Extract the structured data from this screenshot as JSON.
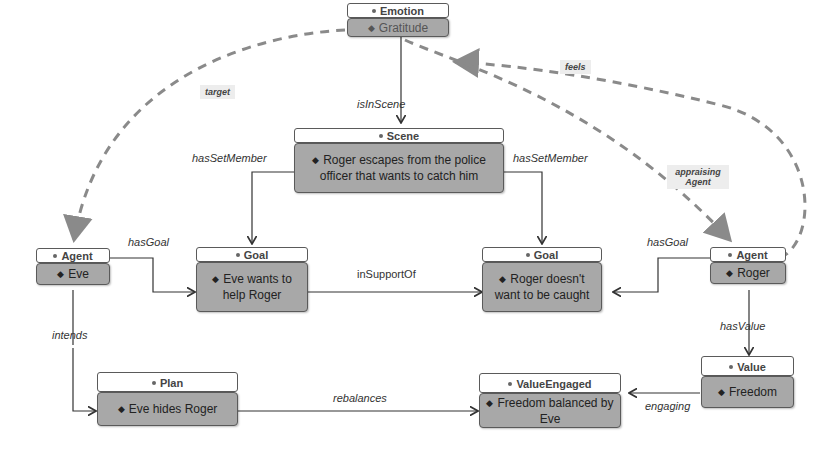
{
  "nodes": {
    "emotion": {
      "type": "Emotion",
      "value": "Gratitude"
    },
    "scene": {
      "type": "Scene",
      "value": "Roger escapes from the police officer that wants to catch him"
    },
    "agent_eve": {
      "type": "Agent",
      "value": "Eve"
    },
    "goal_eve": {
      "type": "Goal",
      "value": "Eve wants to help Roger"
    },
    "goal_roger": {
      "type": "Goal",
      "value": "Roger doesn't want to be caught"
    },
    "agent_roger": {
      "type": "Agent",
      "value": "Roger"
    },
    "plan": {
      "type": "Plan",
      "value": "Eve hides Roger"
    },
    "value_engaged": {
      "type": "ValueEngaged",
      "value": "Freedom balanced by Eve"
    },
    "value": {
      "type": "Value",
      "value": "Freedom"
    }
  },
  "edges": {
    "target": "target",
    "feels": "feels",
    "appraising_agent": "appraising Agent",
    "is_in_scene": "isInScene",
    "has_set_member_left": "hasSetMember",
    "has_set_member_right": "hasSetMember",
    "has_goal_eve": "hasGoal",
    "has_goal_roger": "hasGoal",
    "in_support_of": "inSupportOf",
    "intends": "intends",
    "has_value": "hasValue",
    "rebalances": "rebalances",
    "engaging": "engaging"
  },
  "colors": {
    "node_body": "#a8a8a8",
    "node_header": "#ffffff",
    "dashed_edge": "#8a8a8a",
    "solid_edge": "#333333"
  }
}
